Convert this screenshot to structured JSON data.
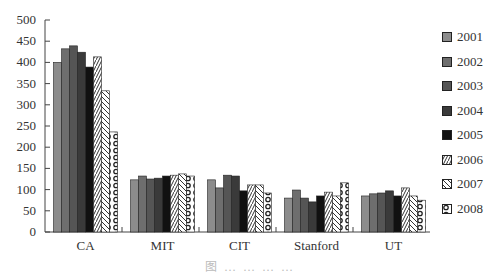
{
  "chart_data": {
    "type": "bar",
    "title": "",
    "xlabel": "",
    "ylabel": "",
    "ylim": [
      0,
      500
    ],
    "yticks": [
      0,
      50,
      100,
      150,
      200,
      250,
      300,
      350,
      400,
      450,
      500
    ],
    "categories": [
      "CA",
      "MIT",
      "CIT",
      "Stanford",
      "UT"
    ],
    "grid": false,
    "legend_position": "right",
    "series": [
      {
        "name": "2001",
        "fill": "#8c8c8c",
        "pattern": "solid",
        "values": [
          400,
          123,
          123,
          80,
          85
        ]
      },
      {
        "name": "2002",
        "fill": "#6e6e6e",
        "pattern": "solid",
        "values": [
          432,
          132,
          104,
          99,
          90
        ]
      },
      {
        "name": "2003",
        "fill": "#555555",
        "pattern": "solid",
        "values": [
          439,
          125,
          134,
          80,
          92
        ]
      },
      {
        "name": "2004",
        "fill": "#3a3a3a",
        "pattern": "solid",
        "values": [
          424,
          127,
          132,
          71,
          97
        ]
      },
      {
        "name": "2005",
        "fill": "#111111",
        "pattern": "solid",
        "values": [
          389,
          132,
          97,
          85,
          85
        ]
      },
      {
        "name": "2006",
        "fill": "#ffffff",
        "pattern": "diag-right",
        "values": [
          413,
          134,
          111,
          94,
          104
        ]
      },
      {
        "name": "2007",
        "fill": "#ffffff",
        "pattern": "diag-left",
        "values": [
          333,
          137,
          111,
          85,
          85
        ]
      },
      {
        "name": "2008",
        "fill": "#ffffff",
        "pattern": "circles",
        "values": [
          236,
          132,
          92,
          116,
          75
        ]
      }
    ]
  },
  "caption": "图 … … … …"
}
